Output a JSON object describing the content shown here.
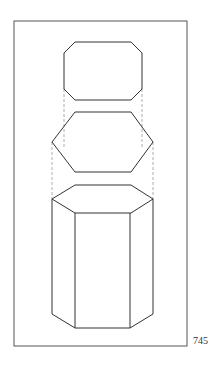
{
  "figure": {
    "views": [
      {
        "name": "top-view",
        "label": "Top view (chamfered rectangle)"
      },
      {
        "name": "end-view",
        "label": "Hexagon view"
      },
      {
        "name": "pictorial-view",
        "label": "Hexagonal prism"
      }
    ],
    "colors": {
      "line": "#333333",
      "frame": "#555555",
      "dash": "#777777",
      "background": "#ffffff"
    }
  },
  "page_number": "745"
}
